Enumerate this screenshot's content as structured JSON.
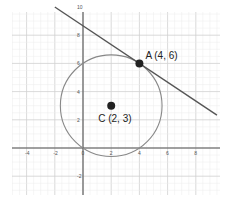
{
  "chart_data": {
    "type": "scatter",
    "title": "",
    "xlabel": "",
    "ylabel": "",
    "xlim": [
      -5,
      9.5
    ],
    "ylim": [
      -3.3,
      10
    ],
    "grid": true,
    "x_ticks": [
      -4,
      -2,
      0,
      2,
      4,
      6,
      8
    ],
    "y_ticks": [
      -2,
      0,
      2,
      4,
      6,
      8,
      10
    ],
    "points": [
      {
        "name": "A",
        "label": "A (4, 6)",
        "x": 4,
        "y": 6
      },
      {
        "name": "C",
        "label": "C (2, 3)",
        "x": 2,
        "y": 3
      }
    ],
    "circle": {
      "center": [
        2,
        3
      ],
      "radius": 3.606,
      "equation": "(x-2)^2 + (y-3)^2 = 13"
    },
    "tangent_line": {
      "through": [
        4,
        6
      ],
      "slope": -0.6667,
      "x_range": [
        -2,
        9.5
      ]
    }
  },
  "labels": {
    "point_a": "A (4, 6)",
    "point_c": "C (2, 3)"
  },
  "colors": {
    "circle": "#888888",
    "line": "#555555",
    "point": "#222222"
  }
}
